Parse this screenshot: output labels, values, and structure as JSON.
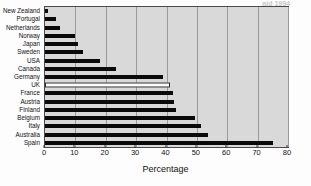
{
  "figure": {
    "title_partial": "aid 1994",
    "source_note": "Source: Adapted from The Reality of Aid '94 (Action Aid)"
  },
  "chart_data": {
    "type": "bar",
    "orientation": "horizontal",
    "title": "",
    "xlabel": "Percentage",
    "ylabel": "",
    "xlim": [
      0,
      80
    ],
    "xticks": [
      0,
      10,
      20,
      30,
      40,
      50,
      60,
      70,
      80
    ],
    "grid": "vertical",
    "legend": "none",
    "highlight_category": "UK",
    "highlight_style": "hollow-white-bar",
    "series_color": "#0a0a0a",
    "plot_background": "#d9d9d9",
    "categories": [
      "New Zealand",
      "Portugal",
      "Netherlands",
      "Norway",
      "Japan",
      "Sweden",
      "USA",
      "Canada",
      "Germany",
      "UK",
      "France",
      "Austria",
      "Finland",
      "Belgium",
      "Italy",
      "Australia",
      "Spain"
    ],
    "values": [
      1,
      3.5,
      5,
      10,
      11,
      12.5,
      18,
      23.5,
      39,
      41,
      42,
      42.5,
      43,
      49.5,
      51.5,
      53.5,
      75
    ]
  }
}
